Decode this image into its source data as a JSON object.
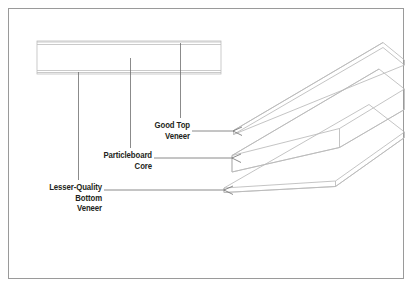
{
  "figure": {
    "type": "technical-illustration",
    "background_color": "#ffffff",
    "border_color": "#9a9a9a",
    "line_color": "#b9b9b9",
    "text_color": "#231f20"
  },
  "labels": {
    "good_top_veneer": "Good Top\nVeneer",
    "particleboard_core": "Particleboard\nCore",
    "lesser_quality_bottom_veneer": "Lesser-Quality\nBottom\nVeneer"
  },
  "layers": [
    {
      "name": "good-top-veneer",
      "label": "Good Top Veneer",
      "position": "top",
      "thickness": "thin"
    },
    {
      "name": "particleboard-core",
      "label": "Particleboard Core",
      "position": "middle",
      "thickness": "thick"
    },
    {
      "name": "lesser-quality-bottom-veneer",
      "label": "Lesser-Quality Bottom Veneer",
      "position": "bottom",
      "thickness": "thin"
    }
  ],
  "cross_section": {
    "name": "edge-cross-section",
    "description": "Edge view rectangle showing thin top veneer, thick core, thin bottom veneer"
  }
}
